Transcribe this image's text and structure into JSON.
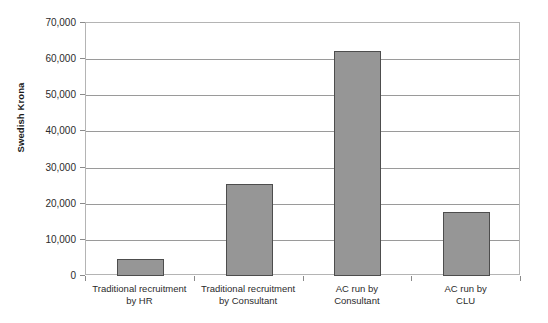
{
  "chart_data": {
    "type": "bar",
    "title": "",
    "xlabel": "",
    "ylabel": "Swedish Krona",
    "categories": [
      "Traditional recruitment by HR",
      "Traditional recruitment by Consultant",
      "AC run by Consultant",
      "AC run by CLU"
    ],
    "category_lines": [
      [
        "Traditional recruitment",
        "by HR"
      ],
      [
        "Traditional recruitment",
        "by Consultant"
      ],
      [
        "AC run by",
        "Consultant"
      ],
      [
        "AC run by",
        "CLU"
      ]
    ],
    "values": [
      4800,
      25500,
      62300,
      17700
    ],
    "ylim": [
      0,
      70000
    ],
    "ytick_labels": [
      "70,000",
      "60,000",
      "50,000",
      "40,000",
      "30,000",
      "20,000",
      "10,000",
      "0"
    ],
    "ytick_values": [
      70000,
      60000,
      50000,
      40000,
      30000,
      20000,
      10000,
      0
    ],
    "grid": true,
    "legend": "none",
    "colors": {
      "bar_fill": "#969696",
      "bar_border": "#4d4d4d",
      "gridline": "#9a9a9a",
      "plot_border": "#b4b4b4",
      "background": "#ffffff",
      "text": "#2b2b2b"
    }
  }
}
